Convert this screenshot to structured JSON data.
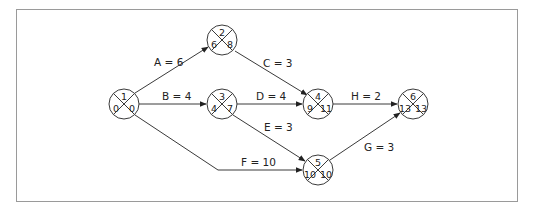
{
  "diagram": {
    "type": "activity-on-arrow network",
    "nodes": [
      {
        "id": "1",
        "number": "1",
        "earliest": "0",
        "latest": "0",
        "cx": 124,
        "cy": 104
      },
      {
        "id": "2",
        "number": "2",
        "earliest": "6",
        "latest": "8",
        "cx": 222,
        "cy": 40
      },
      {
        "id": "3",
        "number": "3",
        "earliest": "4",
        "latest": "7",
        "cx": 222,
        "cy": 104
      },
      {
        "id": "4",
        "number": "4",
        "earliest": "9",
        "latest": "11",
        "cx": 318,
        "cy": 104
      },
      {
        "id": "5",
        "number": "5",
        "earliest": "10",
        "latest": "10",
        "cx": 318,
        "cy": 170
      },
      {
        "id": "6",
        "number": "6",
        "earliest": "13",
        "latest": "13",
        "cx": 413,
        "cy": 104
      }
    ],
    "edges": [
      {
        "id": "A",
        "label": "A = 6",
        "from": "1",
        "to": "2"
      },
      {
        "id": "B",
        "label": "B = 4",
        "from": "1",
        "to": "3"
      },
      {
        "id": "C",
        "label": "C = 3",
        "from": "2",
        "to": "4"
      },
      {
        "id": "D",
        "label": "D = 4",
        "from": "3",
        "to": "4"
      },
      {
        "id": "E",
        "label": "E = 3",
        "from": "3",
        "to": "5"
      },
      {
        "id": "F",
        "label": "F = 10",
        "from": "1",
        "to": "5"
      },
      {
        "id": "G",
        "label": "G = 3",
        "from": "5",
        "to": "6"
      },
      {
        "id": "H",
        "label": "H = 2",
        "from": "4",
        "to": "6"
      }
    ]
  }
}
